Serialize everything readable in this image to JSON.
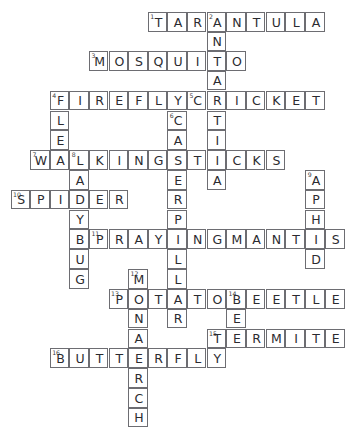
{
  "puzzle": {
    "type": "crossword",
    "theme": "Insects and Bugs",
    "grid": {
      "columns": 17,
      "rows": 18,
      "cell_size": 19.6,
      "origin_x": 10.5,
      "origin_y": 12.0
    },
    "style": {
      "ink": "#2b2b30",
      "rule": "#6d6d72",
      "paper": "#ffffff"
    },
    "entries": [
      {
        "number": "1",
        "answer": "TARANTULA",
        "direction": "across",
        "row": 0,
        "col": 7,
        "length": 9
      },
      {
        "number": "2",
        "answer": "ANTARCTICA",
        "direction": "down",
        "row": 0,
        "col": 10,
        "length": 10
      },
      {
        "number": "3",
        "answer": "MOSQUITO",
        "direction": "across",
        "row": 2,
        "col": 4,
        "length": 8
      },
      {
        "number": "4",
        "answer": "FIREFLY",
        "direction": "across",
        "row": 4,
        "col": 2,
        "length": 7
      },
      {
        "number": "4b",
        "answer": "FLEA",
        "direction": "down",
        "row": 4,
        "col": 2,
        "length": 4
      },
      {
        "number": "5",
        "answer": "CRICKET",
        "direction": "across",
        "row": 4,
        "col": 9,
        "length": 7
      },
      {
        "number": "6",
        "answer": "CATERPILLAR",
        "direction": "down",
        "row": 5,
        "col": 8,
        "length": 11
      },
      {
        "number": "7",
        "answer": "WALKINGSTICKS",
        "direction": "across",
        "row": 7,
        "col": 1,
        "length": 13
      },
      {
        "number": "8",
        "answer": "LADYBUG",
        "direction": "down",
        "row": 7,
        "col": 3,
        "length": 7
      },
      {
        "number": "9",
        "answer": "APHID",
        "direction": "down",
        "row": 8,
        "col": 15,
        "length": 5
      },
      {
        "number": "10",
        "answer": "SPIDER",
        "direction": "across",
        "row": 9,
        "col": 0,
        "length": 6
      },
      {
        "number": "11",
        "answer": "PRAYINGMANTIS",
        "direction": "across",
        "row": 11,
        "col": 4,
        "length": 13
      },
      {
        "number": "12",
        "answer": "MONARCH",
        "direction": "down",
        "row": 12,
        "col": 6,
        "length": 7
      },
      {
        "number": "13",
        "answer": "POTATOBEETLE",
        "direction": "across",
        "row": 13,
        "col": 5,
        "length": 12
      },
      {
        "number": "14",
        "answer": "BEE",
        "direction": "down",
        "row": 13,
        "col": 11,
        "length": 3
      },
      {
        "number": "15",
        "answer": "TERMITE",
        "direction": "across",
        "row": 15,
        "col": 10,
        "length": 7
      },
      {
        "number": "16",
        "answer": "BUTTERFLY",
        "direction": "across",
        "row": 16,
        "col": 2,
        "length": 9
      }
    ],
    "cells": [
      {
        "row": 0,
        "col": 7,
        "letter": "T",
        "number": "1"
      },
      {
        "row": 0,
        "col": 8,
        "letter": "A"
      },
      {
        "row": 0,
        "col": 9,
        "letter": "R"
      },
      {
        "row": 0,
        "col": 10,
        "letter": "A",
        "number": "2"
      },
      {
        "row": 0,
        "col": 11,
        "letter": "N"
      },
      {
        "row": 0,
        "col": 12,
        "letter": "T"
      },
      {
        "row": 0,
        "col": 13,
        "letter": "U"
      },
      {
        "row": 0,
        "col": 14,
        "letter": "L"
      },
      {
        "row": 0,
        "col": 15,
        "letter": "A"
      },
      {
        "row": 1,
        "col": 10,
        "letter": "N"
      },
      {
        "row": 2,
        "col": 4,
        "letter": "M",
        "number": "3"
      },
      {
        "row": 2,
        "col": 5,
        "letter": "O"
      },
      {
        "row": 2,
        "col": 6,
        "letter": "S"
      },
      {
        "row": 2,
        "col": 7,
        "letter": "Q"
      },
      {
        "row": 2,
        "col": 8,
        "letter": "U"
      },
      {
        "row": 2,
        "col": 9,
        "letter": "I"
      },
      {
        "row": 2,
        "col": 10,
        "letter": "T"
      },
      {
        "row": 2,
        "col": 11,
        "letter": "O"
      },
      {
        "row": 3,
        "col": 10,
        "letter": "A"
      },
      {
        "row": 4,
        "col": 2,
        "letter": "F",
        "number": "4"
      },
      {
        "row": 4,
        "col": 3,
        "letter": "I"
      },
      {
        "row": 4,
        "col": 4,
        "letter": "R"
      },
      {
        "row": 4,
        "col": 5,
        "letter": "E"
      },
      {
        "row": 4,
        "col": 6,
        "letter": "F"
      },
      {
        "row": 4,
        "col": 7,
        "letter": "L"
      },
      {
        "row": 4,
        "col": 8,
        "letter": "Y"
      },
      {
        "row": 4,
        "col": 9,
        "letter": "C",
        "number": "5"
      },
      {
        "row": 4,
        "col": 10,
        "letter": "R"
      },
      {
        "row": 4,
        "col": 11,
        "letter": "I"
      },
      {
        "row": 4,
        "col": 12,
        "letter": "C"
      },
      {
        "row": 4,
        "col": 13,
        "letter": "K"
      },
      {
        "row": 4,
        "col": 14,
        "letter": "E"
      },
      {
        "row": 4,
        "col": 15,
        "letter": "T"
      },
      {
        "row": 5,
        "col": 2,
        "letter": "L"
      },
      {
        "row": 5,
        "col": 8,
        "letter": "C",
        "number": "6"
      },
      {
        "row": 5,
        "col": 10,
        "letter": "T"
      },
      {
        "row": 6,
        "col": 2,
        "letter": "E"
      },
      {
        "row": 6,
        "col": 8,
        "letter": "A"
      },
      {
        "row": 6,
        "col": 10,
        "letter": "I"
      },
      {
        "row": 7,
        "col": 1,
        "letter": "W",
        "number": "7"
      },
      {
        "row": 7,
        "col": 2,
        "letter": "A"
      },
      {
        "row": 7,
        "col": 3,
        "letter": "L",
        "number": "8"
      },
      {
        "row": 7,
        "col": 4,
        "letter": "K"
      },
      {
        "row": 7,
        "col": 5,
        "letter": "I"
      },
      {
        "row": 7,
        "col": 6,
        "letter": "N"
      },
      {
        "row": 7,
        "col": 7,
        "letter": "G"
      },
      {
        "row": 7,
        "col": 8,
        "letter": "S"
      },
      {
        "row": 7,
        "col": 9,
        "letter": "T"
      },
      {
        "row": 7,
        "col": 10,
        "letter": "I"
      },
      {
        "row": 7,
        "col": 11,
        "letter": "C"
      },
      {
        "row": 7,
        "col": 12,
        "letter": "K"
      },
      {
        "row": 7,
        "col": 13,
        "letter": "S"
      },
      {
        "row": 8,
        "col": 3,
        "letter": "A"
      },
      {
        "row": 8,
        "col": 8,
        "letter": "E"
      },
      {
        "row": 8,
        "col": 10,
        "letter": "A"
      },
      {
        "row": 8,
        "col": 15,
        "letter": "A",
        "number": "9"
      },
      {
        "row": 9,
        "col": 0,
        "letter": "S",
        "number": "10"
      },
      {
        "row": 9,
        "col": 1,
        "letter": "P"
      },
      {
        "row": 9,
        "col": 2,
        "letter": "I"
      },
      {
        "row": 9,
        "col": 3,
        "letter": "D"
      },
      {
        "row": 9,
        "col": 4,
        "letter": "E"
      },
      {
        "row": 9,
        "col": 5,
        "letter": "R"
      },
      {
        "row": 9,
        "col": 8,
        "letter": "R"
      },
      {
        "row": 9,
        "col": 15,
        "letter": "P"
      },
      {
        "row": 10,
        "col": 3,
        "letter": "Y"
      },
      {
        "row": 10,
        "col": 8,
        "letter": "P"
      },
      {
        "row": 10,
        "col": 15,
        "letter": "H"
      },
      {
        "row": 11,
        "col": 3,
        "letter": "B"
      },
      {
        "row": 11,
        "col": 4,
        "letter": "P",
        "number": "11"
      },
      {
        "row": 11,
        "col": 5,
        "letter": "R"
      },
      {
        "row": 11,
        "col": 6,
        "letter": "A"
      },
      {
        "row": 11,
        "col": 7,
        "letter": "Y"
      },
      {
        "row": 11,
        "col": 8,
        "letter": "I"
      },
      {
        "row": 11,
        "col": 9,
        "letter": "N"
      },
      {
        "row": 11,
        "col": 10,
        "letter": "G"
      },
      {
        "row": 11,
        "col": 11,
        "letter": "M"
      },
      {
        "row": 11,
        "col": 12,
        "letter": "A"
      },
      {
        "row": 11,
        "col": 13,
        "letter": "N"
      },
      {
        "row": 11,
        "col": 14,
        "letter": "T"
      },
      {
        "row": 11,
        "col": 15,
        "letter": "I"
      },
      {
        "row": 11,
        "col": 16,
        "letter": "S"
      },
      {
        "row": 12,
        "col": 3,
        "letter": "U"
      },
      {
        "row": 12,
        "col": 8,
        "letter": "L"
      },
      {
        "row": 12,
        "col": 15,
        "letter": "D"
      },
      {
        "row": 13,
        "col": 3,
        "letter": "G"
      },
      {
        "row": 13,
        "col": 6,
        "letter": "M",
        "number": "12"
      },
      {
        "row": 13,
        "col": 8,
        "letter": "L"
      },
      {
        "row": 14,
        "col": 5,
        "letter": "P",
        "number": "13"
      },
      {
        "row": 14,
        "col": 6,
        "letter": "O"
      },
      {
        "row": 14,
        "col": 7,
        "letter": "T"
      },
      {
        "row": 14,
        "col": 8,
        "letter": "A"
      },
      {
        "row": 14,
        "col": 9,
        "letter": "T"
      },
      {
        "row": 14,
        "col": 10,
        "letter": "O"
      },
      {
        "row": 14,
        "col": 11,
        "letter": "B",
        "number": "14"
      },
      {
        "row": 14,
        "col": 12,
        "letter": "E"
      },
      {
        "row": 14,
        "col": 13,
        "letter": "E"
      },
      {
        "row": 14,
        "col": 14,
        "letter": "T"
      },
      {
        "row": 14,
        "col": 15,
        "letter": "L"
      },
      {
        "row": 14,
        "col": 16,
        "letter": "E"
      },
      {
        "row": 15,
        "col": 6,
        "letter": "N"
      },
      {
        "row": 15,
        "col": 8,
        "letter": "R"
      },
      {
        "row": 15,
        "col": 11,
        "letter": "E"
      },
      {
        "row": 16,
        "col": 6,
        "letter": "A"
      },
      {
        "row": 16,
        "col": 10,
        "letter": "T",
        "number": "15"
      },
      {
        "row": 16,
        "col": 11,
        "letter": "E"
      },
      {
        "row": 16,
        "col": 12,
        "letter": "R"
      },
      {
        "row": 16,
        "col": 13,
        "letter": "M"
      },
      {
        "row": 16,
        "col": 14,
        "letter": "I"
      },
      {
        "row": 16,
        "col": 15,
        "letter": "T"
      },
      {
        "row": 16,
        "col": 16,
        "letter": "E"
      },
      {
        "row": 17,
        "col": 2,
        "letter": "B",
        "number": "16"
      },
      {
        "row": 17,
        "col": 3,
        "letter": "U"
      },
      {
        "row": 17,
        "col": 4,
        "letter": "T"
      },
      {
        "row": 17,
        "col": 5,
        "letter": "T"
      },
      {
        "row": 17,
        "col": 6,
        "letter": "E"
      },
      {
        "row": 17,
        "col": 7,
        "letter": "R"
      },
      {
        "row": 17,
        "col": 8,
        "letter": "F"
      },
      {
        "row": 17,
        "col": 9,
        "letter": "L"
      },
      {
        "row": 17,
        "col": 10,
        "letter": "Y"
      },
      {
        "row": 18,
        "col": 6,
        "letter": "R"
      },
      {
        "row": 19,
        "col": 6,
        "letter": "C"
      },
      {
        "row": 20,
        "col": 6,
        "letter": "H"
      }
    ]
  }
}
